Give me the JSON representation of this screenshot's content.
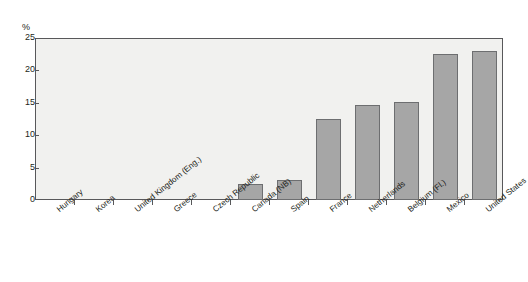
{
  "chart_data": {
    "type": "bar",
    "title": "",
    "subtitle": "",
    "xlabel": "",
    "ylabel": "",
    "unit_label": "%",
    "ylim": [
      0,
      25
    ],
    "yticks": [
      0,
      5,
      10,
      15,
      20,
      25
    ],
    "ytick_labels": [
      "0",
      "5",
      "10",
      "15",
      "20",
      "25"
    ],
    "grid": false,
    "legend": null,
    "categories": [
      "Hungary",
      "Korea",
      "United Kingdom (Eng.)",
      "Greece",
      "Czech Republic",
      "Canada (NB)",
      "Spain",
      "France",
      "Netherlands",
      "Belgium (Fl.)",
      "Mexico",
      "United States"
    ],
    "values": [
      0,
      0,
      0,
      0,
      0,
      2.4,
      3.1,
      12.5,
      14.7,
      15.2,
      22.6,
      23.0
    ],
    "bar_color": "#a6a6a6",
    "bar_border_color": "#6d6e70",
    "plot_background": "#f1f1ef",
    "axis_color": "#58585a",
    "text_color": "#231f20"
  }
}
